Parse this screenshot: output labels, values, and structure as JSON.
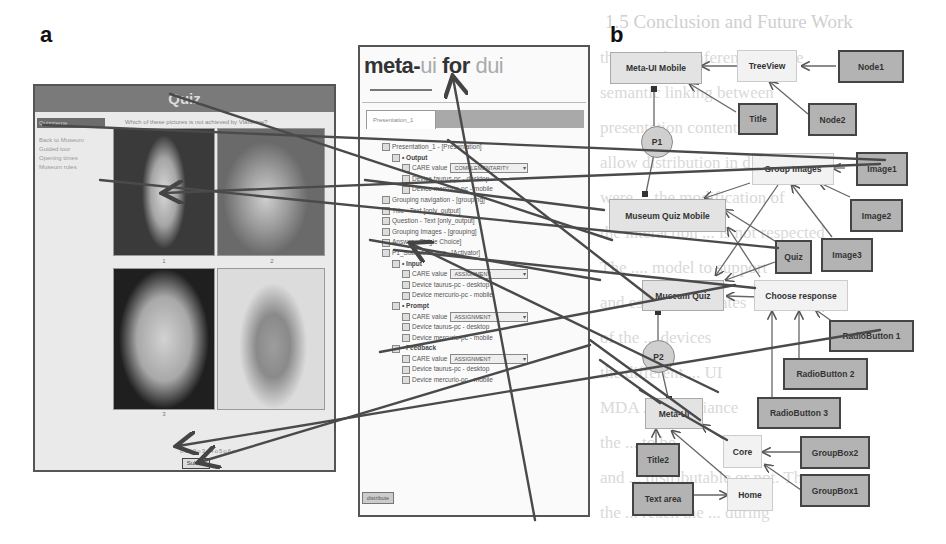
{
  "figure": {
    "panel_a_label": "a",
    "panel_b_label": "b"
  },
  "background_text": {
    "heading": "1.5 Conclusion and Future Work",
    "lines": [
      "the use of an inference engine",
      "semantic linking between",
      "presentation content",
      "allow distribution in different",
      "were ... the modification of",
      "the interaction ... is not respected",
      "The .... model to support",
      "and established states",
      "of the ... devices",
      "the different ... UI",
      "MDA ... compliance",
      "the ... to be",
      "and ... distributable or not. The",
      "the ... reach the ... during"
    ]
  },
  "quiz_app": {
    "title": "Quiz",
    "question": "Which of these pictures is not achieved by Vlaberine?",
    "nav_active": "Quizzieme",
    "nav_items": [
      "Back to Museum",
      "Guided tour",
      "Opening times",
      "Museum rules"
    ],
    "image_captions": [
      "1",
      "2",
      "3",
      "4"
    ],
    "pager": "o1o2o3o4o5o6o",
    "submit_label": "Submit"
  },
  "meta_ui": {
    "title_part1": "meta-",
    "title_part2": "ui ",
    "title_part3": "for ",
    "title_part4": "dui",
    "tab_label": "Presentation_1",
    "tree": [
      {
        "indent": 0,
        "text": "Presentation_1 - [Presentation]",
        "bold": false
      },
      {
        "indent": 1,
        "text": "• Output",
        "bold": true
      },
      {
        "indent": 2,
        "text": "CARE value",
        "select": "COMPLEMENTARITY",
        "bold": false
      },
      {
        "indent": 2,
        "text": "Device taurus-pc - desktop",
        "bold": false
      },
      {
        "indent": 2,
        "text": "Device mercurio-pc - mobile",
        "bold": false
      },
      {
        "indent": 0,
        "text": "Grouping navigation - [grouping]",
        "bold": false
      },
      {
        "indent": 0,
        "text": "Title - Text [only_output]",
        "bold": false
      },
      {
        "indent": 0,
        "text": "Question - Text [only_output]",
        "bold": false
      },
      {
        "indent": 0,
        "text": "Grouping Images - [grouping]",
        "bold": false
      },
      {
        "indent": 0,
        "text": "Answer - Single Choice]",
        "bold": false
      },
      {
        "indent": 0,
        "text": "P1_SubmitAnswer - [Activator]",
        "bold": false
      },
      {
        "indent": 1,
        "text": "• Input",
        "bold": true
      },
      {
        "indent": 2,
        "text": "CARE value",
        "select": "ASSIGNMENT",
        "bold": false
      },
      {
        "indent": 2,
        "text": "Device taurus-pc - desktop",
        "bold": false
      },
      {
        "indent": 2,
        "text": "Device mercurio-pc - mobile",
        "bold": false
      },
      {
        "indent": 1,
        "text": "• Prompt",
        "bold": true
      },
      {
        "indent": 2,
        "text": "CARE value",
        "select": "ASSIGNMENT",
        "bold": false
      },
      {
        "indent": 2,
        "text": "Device taurus-pc - desktop",
        "bold": false
      },
      {
        "indent": 2,
        "text": "Device mercurio-pc - mobile",
        "bold": false
      },
      {
        "indent": 1,
        "text": "• Feedback",
        "bold": true
      },
      {
        "indent": 2,
        "text": "CARE value",
        "select": "ASSIGNMENT",
        "bold": false
      },
      {
        "indent": 2,
        "text": "Device taurus-pc - desktop",
        "bold": false
      },
      {
        "indent": 2,
        "text": "Device mercurio-pc - mobile",
        "bold": false
      }
    ],
    "distribute_label": "distribute"
  },
  "diagram": {
    "nodes": [
      {
        "id": "meta_ui_mobile",
        "label": "Meta-UI Mobile",
        "kind": "abstract"
      },
      {
        "id": "treeview",
        "label": "TreeView",
        "kind": "light"
      },
      {
        "id": "node1",
        "label": "Node1",
        "kind": "concrete"
      },
      {
        "id": "title",
        "label": "Title",
        "kind": "concrete"
      },
      {
        "id": "node2",
        "label": "Node2",
        "kind": "concrete"
      },
      {
        "id": "p1",
        "label": "P1",
        "kind": "circle"
      },
      {
        "id": "group_images",
        "label": "Group Images",
        "kind": "light"
      },
      {
        "id": "image1",
        "label": "Image1",
        "kind": "concrete"
      },
      {
        "id": "museum_quiz_mobile",
        "label": "Museum Quiz Mobile",
        "kind": "abstract"
      },
      {
        "id": "image2",
        "label": "Image2",
        "kind": "concrete"
      },
      {
        "id": "quiz",
        "label": "Quiz",
        "kind": "concrete"
      },
      {
        "id": "image3",
        "label": "Image3",
        "kind": "concrete"
      },
      {
        "id": "museum_quiz",
        "label": "Museum Quiz",
        "kind": "abstract"
      },
      {
        "id": "choose_response",
        "label": "Choose response",
        "kind": "light"
      },
      {
        "id": "radiobutton1",
        "label": "RadioButton 1",
        "kind": "concrete"
      },
      {
        "id": "p2",
        "label": "P2",
        "kind": "circle"
      },
      {
        "id": "radiobutton2",
        "label": "RadioButton 2",
        "kind": "concrete"
      },
      {
        "id": "radiobutton3",
        "label": "RadioButton 3",
        "kind": "concrete"
      },
      {
        "id": "meta_ui",
        "label": "Meta-UI",
        "kind": "abstract"
      },
      {
        "id": "core",
        "label": "Core",
        "kind": "light"
      },
      {
        "id": "groupbox2",
        "label": "GroupBox2",
        "kind": "concrete"
      },
      {
        "id": "title2",
        "label": "Title2",
        "kind": "concrete"
      },
      {
        "id": "groupbox1",
        "label": "GroupBox1",
        "kind": "concrete"
      },
      {
        "id": "text_area",
        "label": "Text area",
        "kind": "concrete"
      },
      {
        "id": "home",
        "label": "Home",
        "kind": "light"
      }
    ],
    "edges": [
      [
        "treeview",
        "meta_ui_mobile"
      ],
      [
        "node1",
        "treeview"
      ],
      [
        "title",
        "meta_ui_mobile"
      ],
      [
        "node2",
        "treeview"
      ],
      [
        "meta_ui_mobile",
        "p1"
      ],
      [
        "p1",
        "museum_quiz_mobile"
      ],
      [
        "image1",
        "group_images"
      ],
      [
        "image2",
        "group_images"
      ],
      [
        "image3",
        "group_images"
      ],
      [
        "group_images",
        "museum_quiz_mobile"
      ],
      [
        "group_images",
        "museum_quiz"
      ],
      [
        "quiz",
        "museum_quiz_mobile"
      ],
      [
        "quiz",
        "museum_quiz"
      ],
      [
        "choose_response",
        "museum_quiz_mobile"
      ],
      [
        "choose_response",
        "museum_quiz"
      ],
      [
        "radiobutton1",
        "choose_response"
      ],
      [
        "radiobutton2",
        "choose_response"
      ],
      [
        "radiobutton3",
        "choose_response"
      ],
      [
        "museum_quiz",
        "p2"
      ],
      [
        "p2",
        "meta_ui"
      ],
      [
        "title2",
        "meta_ui"
      ],
      [
        "home",
        "meta_ui"
      ],
      [
        "core",
        "meta_ui"
      ],
      [
        "groupbox2",
        "core"
      ],
      [
        "groupbox1",
        "core"
      ],
      [
        "text_area",
        "home"
      ]
    ]
  }
}
